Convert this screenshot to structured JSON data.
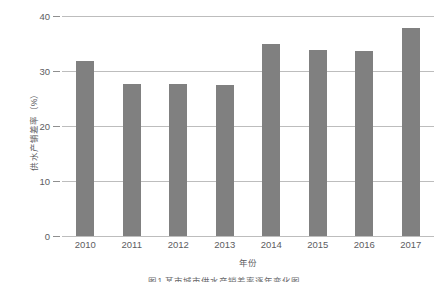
{
  "chart_data": {
    "type": "bar",
    "title": "",
    "xlabel": "年份",
    "ylabel": "供水产销差率（%）",
    "categories": [
      "2010",
      "2011",
      "2012",
      "2013",
      "2014",
      "2015",
      "2016",
      "2017"
    ],
    "values": [
      31.8,
      27.6,
      27.6,
      27.5,
      34.9,
      33.9,
      33.7,
      37.8
    ],
    "ylim": [
      0,
      40
    ],
    "yticks": [
      0,
      10,
      20,
      30,
      40
    ],
    "ytick_labels": [
      "0",
      "10",
      "20",
      "30",
      "40"
    ],
    "grid": true,
    "legend": false,
    "series_name": "供水产销差率",
    "bar_color": "#808080",
    "grid_color": "#bdbdbd",
    "text_color": "#5d5d5f"
  },
  "caption": {
    "text": "图1 某市城市供水产销差率逐年变化图"
  }
}
